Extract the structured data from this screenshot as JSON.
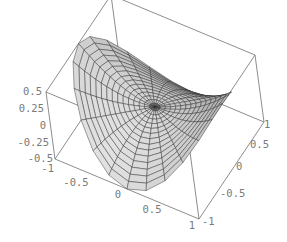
{
  "chart_data": {
    "type": "surface3d",
    "title": "",
    "function": "z = 0.5*(x^2 - y^2)",
    "domain": "polar, r in [0,1], theta in [0, 2pi]",
    "grid": {
      "radial_steps": 15,
      "angular_steps": 24
    },
    "box": true,
    "x_axis": {
      "label": "",
      "range": [
        -1,
        1
      ],
      "ticks": [
        "-1",
        "-0.5",
        "0",
        "0.5",
        "1"
      ]
    },
    "y_axis": {
      "label": "",
      "range": [
        -1,
        1
      ],
      "ticks": [
        "-1",
        "-0.5",
        "0",
        "0.5",
        "1"
      ]
    },
    "z_axis": {
      "label": "",
      "range": [
        -0.5,
        0.5
      ],
      "ticks": [
        "-0.5",
        "-0.25",
        "0",
        "0.25",
        "0.5"
      ]
    },
    "surface_color": "#c8c8c8",
    "mesh_color": "#2a2a2a",
    "box_color": "#707070"
  },
  "labels": {
    "z": [
      "0.5",
      "0.25",
      "0",
      "-0.25",
      "-0.5"
    ],
    "x": [
      "-1",
      "-0.5",
      "0",
      "0.5",
      "1"
    ],
    "y": [
      "-1",
      "-0.5",
      "0",
      "0.5",
      "1"
    ]
  }
}
